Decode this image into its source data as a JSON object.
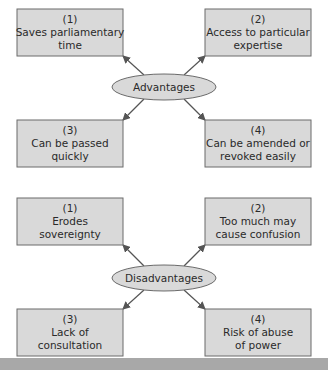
{
  "colors": {
    "box_fill": "#d9d9d9",
    "border": "#6b6b6b",
    "footer_bar": "#a8a8a8"
  },
  "diagrams": [
    {
      "center_label": "Advantages",
      "items": [
        {
          "number": "(1)",
          "lines": [
            "Saves parliamentary",
            "time"
          ]
        },
        {
          "number": "(2)",
          "lines": [
            "Access to particular",
            "expertise"
          ]
        },
        {
          "number": "(3)",
          "lines": [
            "Can be passed",
            "quickly"
          ]
        },
        {
          "number": "(4)",
          "lines": [
            "Can be amended or",
            "revoked easily"
          ]
        }
      ]
    },
    {
      "center_label": "Disadvantages",
      "items": [
        {
          "number": "(1)",
          "lines": [
            "Erodes",
            "sovereignty"
          ]
        },
        {
          "number": "(2)",
          "lines": [
            "Too much may",
            "cause confusion"
          ]
        },
        {
          "number": "(3)",
          "lines": [
            "Lack of",
            "consultation"
          ]
        },
        {
          "number": "(4)",
          "lines": [
            "Risk of abuse",
            "of power"
          ]
        }
      ]
    }
  ]
}
